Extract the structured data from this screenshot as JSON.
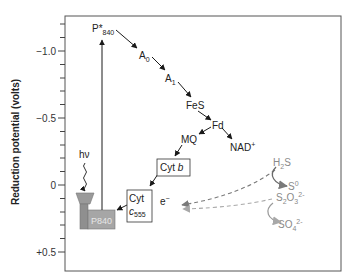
{
  "diagram": {
    "type": "energy-diagram",
    "axis": {
      "title": "Reduction potential (volts)",
      "ticks": [
        {
          "label": "−1.0",
          "value": -1.0
        },
        {
          "label": "−0.5",
          "value": -0.5
        },
        {
          "label": "0",
          "value": 0
        },
        {
          "label": "+0.5",
          "value": 0.5
        }
      ]
    },
    "nodes": {
      "p840_excited": {
        "main": "P*",
        "sub": "840"
      },
      "a0": {
        "main": "A",
        "sub": "0"
      },
      "a1": {
        "main": "A",
        "sub": "1"
      },
      "fes": {
        "main": "FeS"
      },
      "fd": {
        "main": "Fd"
      },
      "mq": {
        "main": "MQ"
      },
      "nad": {
        "main": "NAD",
        "sup": "+"
      },
      "cyt_b": {
        "main": "Cyt ",
        "italic": "b"
      },
      "cyt_c555": {
        "line1": "Cyt",
        "main": "c",
        "sub": "555"
      },
      "p840": {
        "main": "P840"
      },
      "light": {
        "main": "hν"
      },
      "electron": {
        "main": "e",
        "sup": "−"
      },
      "h2s": {
        "main": "H",
        "sub": "2",
        "tail": "S"
      },
      "s0": {
        "main": "S",
        "sup": "0"
      },
      "s2o3": {
        "main": "S",
        "sub1": "2",
        "mid": "O",
        "sub2": "3",
        "sup": "2-"
      },
      "so4": {
        "main": "SO",
        "sub": "4",
        "sup": "2-"
      }
    },
    "colors": {
      "line": "#1a1a1a",
      "gray_flow": "#8c8c8c",
      "reaction_center": "#a6a6a6",
      "reaction_center_dark": "#8f8f8f"
    }
  }
}
